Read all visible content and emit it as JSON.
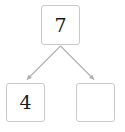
{
  "diagram": {
    "type": "binary-tree-fragment",
    "canvas": {
      "width": 125,
      "height": 132,
      "background": "#ffffff"
    },
    "style": {
      "box_border_color": "#c9c9c9",
      "box_fill_color": "#ffffff",
      "edge_color": "#b0b0b0",
      "text_color": "#1a1a1a"
    },
    "nodes": [
      {
        "id": "root",
        "label": "7",
        "position": "top-center",
        "empty": false
      },
      {
        "id": "left-child",
        "label": "4",
        "position": "bottom-left",
        "empty": false
      },
      {
        "id": "right-child",
        "label": "",
        "position": "bottom-right",
        "empty": true
      }
    ],
    "edges": [
      {
        "from": "root",
        "to": "left-child",
        "arrowhead": true
      },
      {
        "from": "root",
        "to": "right-child",
        "arrowhead": true
      }
    ]
  }
}
